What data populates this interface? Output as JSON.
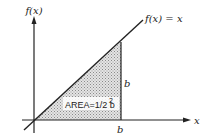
{
  "diagram": {
    "y_axis_label": "f(x)",
    "x_axis_label": "x",
    "function_label": "f(x) = x",
    "vertical_side_label": "b",
    "horizontal_side_label": "b",
    "area_label": "AREA=1/2 b",
    "area_exponent": "2",
    "colors": {
      "line": "#222222",
      "shading": "#c8c8c8",
      "background": "#ffffff"
    }
  }
}
